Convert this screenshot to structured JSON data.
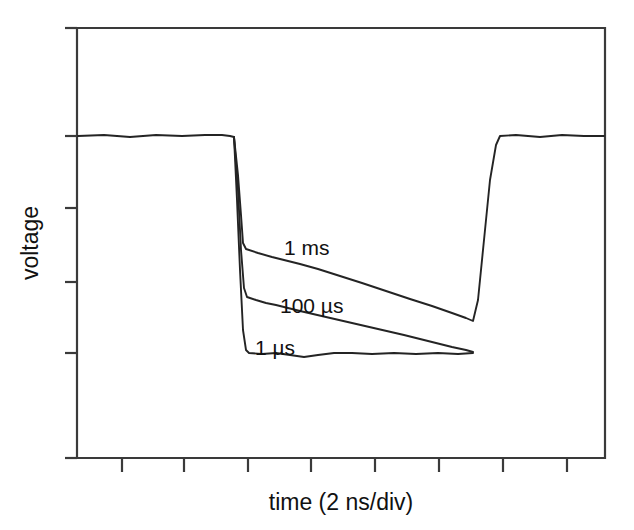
{
  "figure": {
    "background_color": "#ffffff",
    "line_color": "#242424",
    "axis_color": "#3a3a3a",
    "xlabel": "time (2 ns/div)",
    "ylabel": "voltage"
  },
  "chart_data": {
    "type": "line",
    "title": "",
    "subtitle": "",
    "xlabel": "time (2 ns/div)",
    "ylabel": "voltage",
    "grid": false,
    "legend_position": "inline-annotations",
    "x_axis": {
      "units": "ns",
      "per_division": 2,
      "tick_labels": [],
      "n_ticks": 8,
      "tick_pixel_x": [
        122,
        184,
        248,
        311,
        375,
        439,
        503,
        567
      ],
      "range_px": [
        77,
        605
      ]
    },
    "y_axis": {
      "units": "arbitrary",
      "tick_labels": [],
      "n_ticks": 6,
      "tick_pixel_y": [
        28,
        136,
        208,
        282,
        353,
        458
      ],
      "range_px": [
        28,
        458
      ],
      "high_level_px": 136,
      "low_level_px": 353
    },
    "annotations": [
      {
        "text": "1 ms",
        "x_px": 284,
        "y_px": 255
      },
      {
        "text": "100 µs",
        "x_px": 280,
        "y_px": 313
      },
      {
        "text": "1 µs",
        "x_px": 255,
        "y_px": 355
      }
    ],
    "series": [
      {
        "name": "1 ms",
        "label": "1 ms",
        "description": "Slowest recovery: shallowest droop, settles highest during the pulse low period.",
        "points_px": [
          [
            78,
            136
          ],
          [
            104,
            135
          ],
          [
            130,
            137
          ],
          [
            156,
            135
          ],
          [
            182,
            136
          ],
          [
            205,
            135
          ],
          [
            222,
            135
          ],
          [
            230,
            136
          ],
          [
            234,
            137
          ],
          [
            238,
            175
          ],
          [
            241,
            215
          ],
          [
            243,
            243
          ],
          [
            246,
            249
          ],
          [
            258,
            253
          ],
          [
            272,
            257
          ],
          [
            288,
            261
          ],
          [
            300,
            264
          ],
          [
            318,
            269
          ],
          [
            340,
            276
          ],
          [
            362,
            283
          ],
          [
            386,
            291
          ],
          [
            410,
            299
          ],
          [
            432,
            306
          ],
          [
            452,
            313
          ],
          [
            466,
            318
          ],
          [
            473,
            321
          ],
          [
            478,
            300
          ],
          [
            484,
            240
          ],
          [
            490,
            180
          ],
          [
            496,
            145
          ],
          [
            500,
            136
          ],
          [
            516,
            135
          ],
          [
            540,
            137
          ],
          [
            562,
            135
          ],
          [
            584,
            136
          ],
          [
            604,
            136
          ]
        ]
      },
      {
        "name": "100 us",
        "label": "100 µs",
        "description": "Intermediate recovery: deeper initial drop, moderate droop toward the 1 us floor.",
        "points_px": [
          [
            234,
            137
          ],
          [
            238,
            190
          ],
          [
            241,
            250
          ],
          [
            244,
            288
          ],
          [
            247,
            297
          ],
          [
            256,
            300
          ],
          [
            266,
            303
          ],
          [
            276,
            305
          ],
          [
            300,
            311
          ],
          [
            326,
            317
          ],
          [
            352,
            323
          ],
          [
            378,
            329
          ],
          [
            404,
            335
          ],
          [
            428,
            341
          ],
          [
            452,
            347
          ],
          [
            466,
            350
          ],
          [
            473,
            352
          ]
        ]
      },
      {
        "name": "1 us",
        "label": "1 µs",
        "description": "Fastest recovery: falls straight to the flat low level and stays there for the whole pulse.",
        "points_px": [
          [
            234,
            137
          ],
          [
            237,
            200
          ],
          [
            240,
            270
          ],
          [
            243,
            330
          ],
          [
            246,
            350
          ],
          [
            249,
            353
          ],
          [
            262,
            354
          ],
          [
            276,
            353
          ],
          [
            290,
            355
          ],
          [
            304,
            357
          ],
          [
            318,
            355
          ],
          [
            334,
            353
          ],
          [
            352,
            353
          ],
          [
            372,
            354
          ],
          [
            394,
            353
          ],
          [
            416,
            354
          ],
          [
            438,
            353
          ],
          [
            458,
            354
          ],
          [
            473,
            353
          ]
        ]
      }
    ]
  }
}
